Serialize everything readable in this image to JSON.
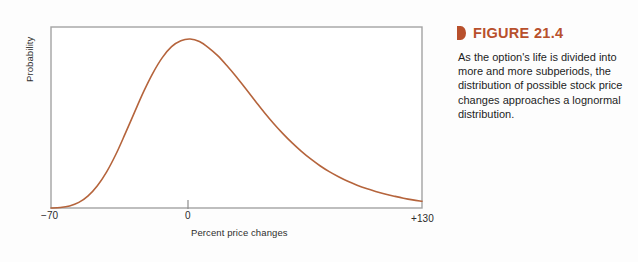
{
  "figure": {
    "marker_icon": "triangle-right-marker-icon",
    "number_label": "FIGURE 21.4",
    "caption": "As the option's life is divided into more and more subperiods, the distribution of possible stock price changes approaches a lognormal distribution.",
    "accent_color": "#b8502c"
  },
  "chart_data": {
    "type": "line",
    "title": "",
    "subtitle": "",
    "xlabel": "Percent price changes",
    "ylabel": "Probability",
    "xlim": [
      -70,
      130
    ],
    "ylim": [
      0,
      1
    ],
    "grid": false,
    "legend": null,
    "series": [
      {
        "name": "Lognormal distribution of stock price changes",
        "color": "#b5643c",
        "x": [
          -70,
          -65,
          -60,
          -55,
          -50,
          -45,
          -40,
          -35,
          -30,
          -25,
          -20,
          -15,
          -10,
          -5,
          0,
          5,
          10,
          15,
          20,
          25,
          30,
          35,
          40,
          45,
          50,
          55,
          60,
          65,
          70,
          75,
          80,
          85,
          90,
          95,
          100,
          105,
          110,
          115,
          120,
          125,
          130
        ],
        "values": [
          0.0,
          0.003,
          0.012,
          0.033,
          0.072,
          0.132,
          0.214,
          0.318,
          0.44,
          0.566,
          0.69,
          0.8,
          0.89,
          0.955,
          0.99,
          1.0,
          0.985,
          0.948,
          0.9,
          0.84,
          0.775,
          0.705,
          0.635,
          0.565,
          0.5,
          0.44,
          0.385,
          0.335,
          0.29,
          0.25,
          0.215,
          0.185,
          0.158,
          0.135,
          0.115,
          0.098,
          0.083,
          0.07,
          0.058,
          0.048,
          0.04
        ]
      }
    ],
    "x_ticks": [
      {
        "value": -70,
        "label": "−70",
        "has_mark": false
      },
      {
        "value": 0,
        "label": "0",
        "has_mark": true
      },
      {
        "value": 130,
        "label": "+130",
        "has_mark": false
      }
    ],
    "y_ticks": [],
    "axis_color": "#9a9a9a",
    "plot_border": true
  }
}
